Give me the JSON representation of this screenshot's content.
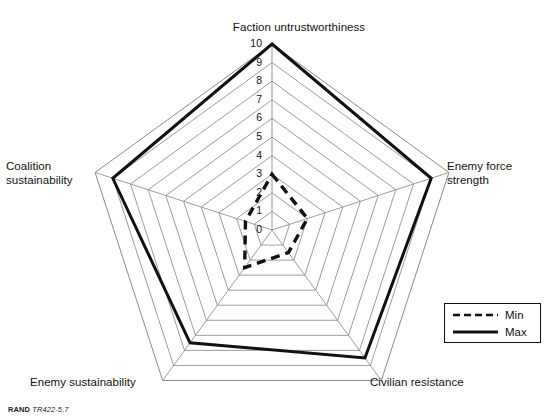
{
  "figure": {
    "source_note_brand": "RAND",
    "source_note_code": "TR422-5.7",
    "top_fragment": "",
    "background_color": "#ffffff",
    "line_color": "#111111",
    "grid_color": "#8a8a8a"
  },
  "legend": {
    "position": "bottom-right",
    "entries": [
      {
        "label": "Min",
        "style": "dashed"
      },
      {
        "label": "Max",
        "style": "solid"
      }
    ]
  },
  "axis_titles": {
    "faction": "Faction untrustworthiness",
    "enemy_force": "Enemy force\nstrength",
    "civilian": "Civilian resistance",
    "enemy_sustainability": "Enemy sustainability",
    "coalition": "Coalition\nsustainability"
  },
  "ticks": {
    "labels": [
      "0",
      "1",
      "2",
      "3",
      "4",
      "5",
      "6",
      "7",
      "8",
      "9",
      "10"
    ]
  },
  "chart_data": {
    "type": "radar",
    "title": "",
    "subtitle": "",
    "xlabel": "",
    "ylabel": "",
    "rlim": [
      0,
      10
    ],
    "rticks": [
      0,
      1,
      2,
      3,
      4,
      5,
      6,
      7,
      8,
      9,
      10
    ],
    "grid": true,
    "grid_shape": "polygon",
    "legend_position": "bottom-right",
    "categories": [
      "Faction untrustworthiness",
      "Enemy force strength",
      "Civilian resistance",
      "Enemy sustainability",
      "Coalition sustainability"
    ],
    "series": [
      {
        "name": "Min",
        "style": "dashed",
        "values": [
          3,
          2,
          1.5,
          2.5,
          1.5
        ]
      },
      {
        "name": "Max",
        "style": "solid",
        "values": [
          10,
          9,
          8.5,
          7.5,
          9
        ]
      }
    ]
  }
}
